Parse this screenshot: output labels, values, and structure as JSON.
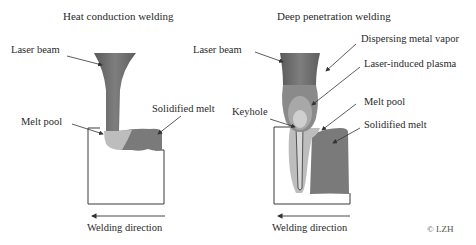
{
  "left_panel": {
    "title": "Heat conduction welding",
    "labels": {
      "laser_beam": "Laser beam",
      "solidified_melt": "Solidified melt",
      "melt_pool": "Melt pool"
    },
    "direction": "Welding direction"
  },
  "right_panel": {
    "title": "Deep penetration welding",
    "labels": {
      "laser_beam": "Laser beam",
      "dispersing_metal_vapor": "Dispersing metal vapor",
      "laser_induced_plasma": "Laser-induced plasma",
      "keyhole": "Keyhole",
      "melt_pool": "Melt pool",
      "solidified_melt": "Solidified melt"
    },
    "direction": "Welding direction"
  },
  "copyright": "© LZH",
  "colors": {
    "beam": "#6e6e6e",
    "melt_pool": "#bdbdbd",
    "solidified": "#7a7a7a",
    "plasma": "#a8a8a8",
    "vapor": "#8a8a8a",
    "outline": "#3a3a3a"
  }
}
